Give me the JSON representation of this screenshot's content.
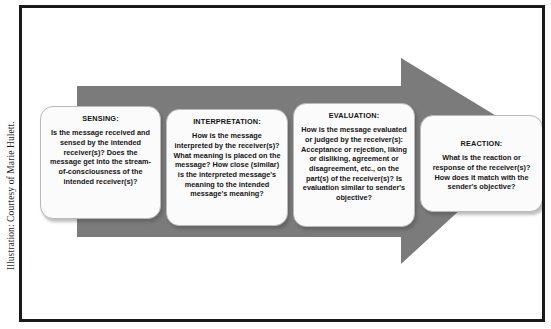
{
  "credit": {
    "text": "Illustration: Courtesy of Marie Hulett."
  },
  "colors": {
    "arrow_fill": "#7b7b7b",
    "box_fill": "#fbfbfb",
    "box_border": "#b9b9b9",
    "frame_border": "#1a1a1a",
    "page_background": "#ffffff",
    "text": "#141414"
  },
  "diagram": {
    "type": "process-flow-arrow",
    "direction": "left-to-right",
    "stage_count": 4,
    "arrow": {
      "name": "process-arrow",
      "fill": "#7b7b7b"
    },
    "stages": [
      {
        "id": "sensing",
        "title": "SENSING:",
        "body": "Is the message received and sensed by the intended receiver(s)? Does the message get into the stream-of-consciousness of the intended receiver(s)?"
      },
      {
        "id": "interpretation",
        "title": "INTERPRETATION:",
        "body": "How is the message interpreted by the receiver(s)? What meaning is placed on the message? How close (similar) is the interpreted message's meaning to the intended message's meaning?"
      },
      {
        "id": "evaluation",
        "title": "EVALUATION:",
        "body": "How is the message evaluated or judged by the receiver(s): Acceptance or rejection, liking or disliking, agreement or disagreement, etc., on the part(s) of the receiver(s)? Is evaluation similar to sender's objective?"
      },
      {
        "id": "reaction",
        "title": "REACTION:",
        "body": "What is the reaction or response of the receiver(s)? How does it match with the sender's objective?"
      }
    ]
  }
}
